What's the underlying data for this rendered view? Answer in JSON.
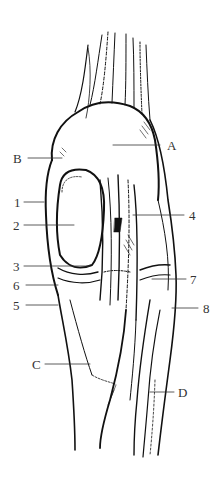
{
  "figure": {
    "labels": [
      {
        "id": "A",
        "text": "A",
        "x": 167,
        "y": 139,
        "line": [
          113,
          145,
          160,
          145
        ]
      },
      {
        "id": "B",
        "text": "B",
        "x": 13,
        "y": 152,
        "line": [
          28,
          158,
          62,
          158
        ]
      },
      {
        "id": "1",
        "text": "1",
        "x": 14,
        "y": 196,
        "line": [
          24,
          202,
          44,
          202
        ]
      },
      {
        "id": "2",
        "text": "2",
        "x": 13,
        "y": 219,
        "line": [
          24,
          225,
          74,
          225
        ]
      },
      {
        "id": "3",
        "text": "3",
        "x": 13,
        "y": 262,
        "line": [
          24,
          266,
          90,
          266
        ]
      },
      {
        "id": "6",
        "text": "6",
        "x": 13,
        "y": 280,
        "line": [
          26,
          285,
          58,
          285
        ]
      },
      {
        "id": "5",
        "text": "5",
        "x": 13,
        "y": 299,
        "line": [
          26,
          305,
          58,
          305
        ]
      },
      {
        "id": "C",
        "text": "C",
        "x": 32,
        "y": 358,
        "line": [
          45,
          364,
          90,
          364
        ]
      },
      {
        "id": "4",
        "text": "4",
        "x": 189,
        "y": 209,
        "line": [
          133,
          215,
          184,
          215
        ]
      },
      {
        "id": "7",
        "text": "7",
        "x": 190,
        "y": 273,
        "line": [
          152,
          279,
          186,
          279
        ]
      },
      {
        "id": "8",
        "text": "8",
        "x": 203,
        "y": 302,
        "line": [
          172,
          308,
          198,
          308
        ]
      },
      {
        "id": "D",
        "text": "D",
        "x": 178,
        "y": 386,
        "line": [
          150,
          392,
          174,
          392
        ]
      }
    ]
  }
}
